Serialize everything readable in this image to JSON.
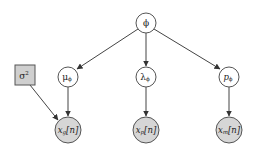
{
  "diagram": {
    "type": "graphical-model",
    "colors": {
      "latent_fill": "#ffffff",
      "observed_fill": "#d6d6d6",
      "param_fill": "#cfcfcf",
      "stroke": "#555555",
      "edge": "#444444"
    },
    "nodes": [
      {
        "id": "phi",
        "label": "ϕ",
        "kind": "latent"
      },
      {
        "id": "sigma2",
        "label": "σ²",
        "kind": "fixed-parameter"
      },
      {
        "id": "mu_phi",
        "label": "μϕ",
        "kind": "latent"
      },
      {
        "id": "lambda_phi",
        "label": "λϕ",
        "kind": "latent"
      },
      {
        "id": "p_phi",
        "label": "pϕ",
        "kind": "latent"
      },
      {
        "id": "x_g",
        "label": "xg[n]",
        "kind": "observed"
      },
      {
        "id": "x_p",
        "label": "xp[n]",
        "kind": "observed"
      },
      {
        "id": "x_m",
        "label": "xm[n]",
        "kind": "observed"
      }
    ],
    "edges": [
      {
        "from": "phi",
        "to": "mu_phi"
      },
      {
        "from": "phi",
        "to": "lambda_phi"
      },
      {
        "from": "phi",
        "to": "p_phi"
      },
      {
        "from": "sigma2",
        "to": "x_g"
      },
      {
        "from": "mu_phi",
        "to": "x_g"
      },
      {
        "from": "lambda_phi",
        "to": "x_p"
      },
      {
        "from": "p_phi",
        "to": "x_m"
      }
    ],
    "labels": {
      "phi": "ϕ",
      "sigma": "σ",
      "sigma_sup": "2",
      "mu": "μ",
      "lambda": "λ",
      "p": "p",
      "sub_phi": "ϕ",
      "x": "x",
      "sub_g": "g",
      "sub_p": "p",
      "sub_m": "m",
      "index": "[n]"
    }
  }
}
